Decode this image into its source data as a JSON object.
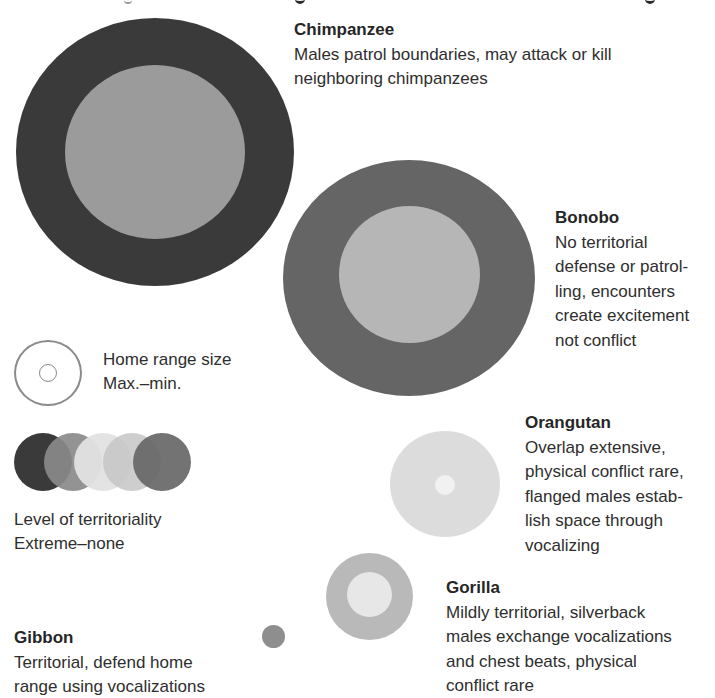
{
  "figure": {
    "species": [
      {
        "name": "Chimpanzee",
        "description_lines": [
          "Males patrol boundaries, may attack or kill",
          "neighboring chimpanzees"
        ],
        "outer_color": "#3a3a3a",
        "inner_color": "#9b9b9b"
      },
      {
        "name": "Bonobo",
        "description_lines": [
          "No territorial",
          "defense or patrol-",
          "ling, encounters",
          "create excitement",
          "not conflict"
        ],
        "outer_color": "#656565",
        "inner_color": "#b6b6b6"
      },
      {
        "name": "Orangutan",
        "description_lines": [
          "Overlap extensive,",
          "physical conflict rare,",
          "flanged males estab-",
          "lish space through",
          "vocalizing"
        ],
        "outer_color": "#dcdcdc",
        "inner_color": "#f1f1f1"
      },
      {
        "name": "Gorilla",
        "description_lines": [
          "Mildly territorial, silverback",
          "males exchange vocalizations",
          "and chest beats, physical",
          "conflict rare"
        ],
        "outer_color": "#b9b9b9",
        "inner_color": "#e7e7e7"
      },
      {
        "name": "Gibbon",
        "description_lines": [
          "Territorial, defend home",
          "range using vocalizations"
        ],
        "outer_color": "#8e8e8e"
      }
    ],
    "legend": {
      "home_range": {
        "label_line1": "Home range size",
        "label_line2": "Max.–min.",
        "icon": "concentric-circles-icon",
        "stroke_color": "#8a8a8a"
      },
      "territoriality": {
        "label_line1": "Level of territoriality",
        "label_line2": "Extreme–none",
        "swatches": [
          "#3a3a3a",
          "#8a8a8a",
          "#e2e2e2",
          "#c6c6c6",
          "#676767"
        ]
      }
    }
  }
}
